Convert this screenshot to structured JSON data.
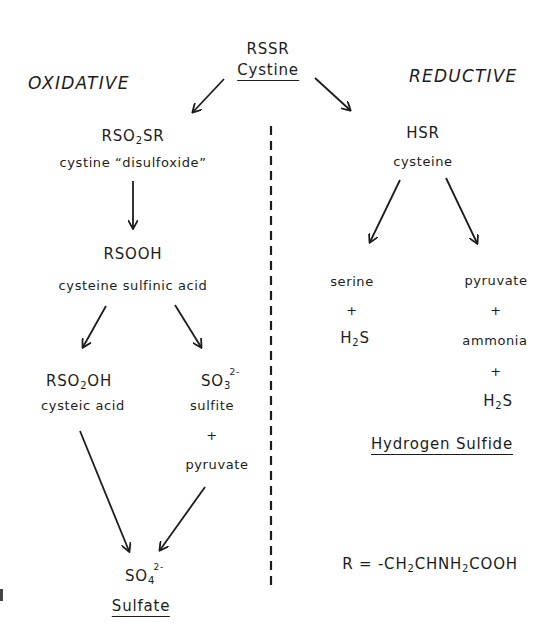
{
  "diagram": {
    "title_sections": {
      "left": "OXIDATIVE",
      "right": "REDUCTIVE"
    },
    "nodes": {
      "cystine": {
        "formula": "RSSR",
        "name": "Cystine"
      },
      "disulfoxide": {
        "formula_parts": [
          "RSO",
          "2",
          "SR"
        ],
        "name": "cystine “disulfoxide”"
      },
      "sulfinic": {
        "formula": "RSOOH",
        "name": "cysteine sulfinic acid"
      },
      "cysteic": {
        "formula_parts": [
          "RSO",
          "2",
          "OH"
        ],
        "name": "cysteic acid"
      },
      "sulfite": {
        "formula_parts": [
          "SO",
          "3"
        ],
        "charge": "2-",
        "name": "sulfite",
        "plus": "+",
        "coproduct": "pyruvate"
      },
      "sulfate": {
        "formula_parts": [
          "SO",
          "4"
        ],
        "charge": "2-",
        "name": "Sulfate"
      },
      "cysteine": {
        "formula": "HSR",
        "name": "cysteine"
      },
      "serine_branch": {
        "product": "serine",
        "plus": "+",
        "h2s_parts": [
          "H",
          "2",
          "S"
        ]
      },
      "pyruvate_branch": {
        "product": "pyruvate",
        "plus1": "+",
        "second": "ammonia",
        "plus2": "+",
        "h2s_parts": [
          "H",
          "2",
          "S"
        ]
      },
      "hydrogen_sulfide": {
        "name": "Hydrogen Sulfide"
      }
    },
    "legend": {
      "r_def_parts": [
        "R = -CH",
        "2",
        "CHNH",
        "2",
        "COOH"
      ]
    },
    "edges": [
      {
        "from": "cystine",
        "to": "disulfoxide"
      },
      {
        "from": "cystine",
        "to": "cysteine"
      },
      {
        "from": "disulfoxide",
        "to": "sulfinic"
      },
      {
        "from": "sulfinic",
        "to": "cysteic"
      },
      {
        "from": "sulfinic",
        "to": "sulfite"
      },
      {
        "from": "cysteic",
        "to": "sulfate"
      },
      {
        "from": "sulfite",
        "to": "sulfate"
      },
      {
        "from": "cysteine",
        "to": "serine_branch"
      },
      {
        "from": "cysteine",
        "to": "pyruvate_branch"
      }
    ],
    "colors": {
      "ink": "#1c1c1c",
      "background": "#ffffff"
    }
  }
}
